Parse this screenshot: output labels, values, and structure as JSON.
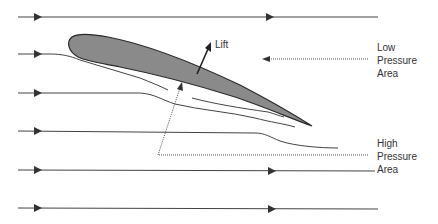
{
  "diagram": {
    "type": "airfoil-lift-pressure",
    "labels": {
      "lift": "Lift",
      "low_pressure": [
        "Low",
        "Pressure",
        "Area"
      ],
      "high_pressure": [
        "High",
        "Pressure",
        "Area"
      ]
    },
    "colors": {
      "airfoil_fill": "#8a8a8a",
      "stroke": "#333333",
      "background": "#ffffff"
    },
    "streamlines_count": 6
  }
}
